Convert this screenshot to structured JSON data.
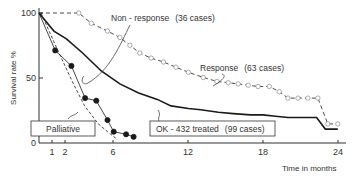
{
  "chart_data": {
    "type": "line",
    "title": "",
    "xlabel": "Time in months",
    "ylabel": "Survival rate %",
    "xlim": [
      0,
      24
    ],
    "ylim": [
      0,
      100
    ],
    "x_ticks": [
      "1",
      "2",
      "6",
      "12",
      "18",
      "24"
    ],
    "y_ticks": [
      "0",
      "50",
      "100"
    ],
    "grid": false,
    "series": [
      {
        "name": "Response (63 cases)",
        "style": "dashed with open circles",
        "points": [
          [
            0,
            100
          ],
          [
            3.2,
            100
          ],
          [
            4.2,
            92
          ],
          [
            5.5,
            86
          ],
          [
            6.5,
            81
          ],
          [
            7.3,
            75
          ],
          [
            8.1,
            69
          ],
          [
            9.0,
            65
          ],
          [
            10.0,
            62
          ],
          [
            11.0,
            58
          ],
          [
            12.0,
            54
          ],
          [
            13.2,
            50
          ],
          [
            14.3,
            47
          ],
          [
            15.2,
            46
          ],
          [
            16.0,
            45
          ],
          [
            16.8,
            44
          ],
          [
            17.6,
            43
          ],
          [
            18.5,
            43
          ],
          [
            19.3,
            39
          ],
          [
            20.0,
            34
          ],
          [
            20.8,
            34
          ],
          [
            21.6,
            34
          ],
          [
            22.4,
            34
          ],
          [
            23.2,
            14
          ],
          [
            24.0,
            14
          ]
        ]
      },
      {
        "name": "OK-432 treated (99 cases)",
        "style": "solid thick",
        "points": [
          [
            0,
            100
          ],
          [
            1.2,
            86
          ],
          [
            2.2,
            80
          ],
          [
            3.5,
            69
          ],
          [
            5.0,
            55
          ],
          [
            6.5,
            45
          ],
          [
            8.0,
            38
          ],
          [
            9.5,
            33
          ],
          [
            10.6,
            28
          ],
          [
            12.0,
            26
          ],
          [
            13.0,
            25
          ],
          [
            14.4,
            23
          ],
          [
            15.6,
            22
          ],
          [
            17.0,
            21
          ],
          [
            18.0,
            21
          ],
          [
            19.0,
            20
          ],
          [
            20.0,
            19
          ],
          [
            21.5,
            19
          ],
          [
            22.3,
            19
          ],
          [
            23.0,
            10
          ],
          [
            24.0,
            10
          ]
        ]
      },
      {
        "name": "Non-response (36 cases)",
        "style": "dashed",
        "points": [
          [
            0,
            100
          ],
          [
            1.4,
            70
          ],
          [
            2.6,
            45
          ],
          [
            3.5,
            28
          ],
          [
            4.6,
            14
          ],
          [
            5.6,
            6
          ],
          [
            6.0,
            3
          ]
        ]
      },
      {
        "name": "Palliative",
        "style": "solid with filled circles",
        "points": [
          [
            0,
            100
          ],
          [
            1.3,
            71
          ],
          [
            2.6,
            59
          ],
          [
            3.7,
            34
          ],
          [
            4.6,
            32
          ],
          [
            5.5,
            17
          ],
          [
            6.0,
            8
          ],
          [
            7.0,
            6
          ],
          [
            7.6,
            4
          ]
        ]
      }
    ],
    "annotations": [
      "Non - response (36 cases)",
      "Response (63 cases)",
      "Palliative",
      "OK - 432 treated (99 cases)"
    ]
  },
  "labels": {
    "nonresponse": "Non - response",
    "nonresponse_cases": "(36 cases)",
    "response": "Response",
    "response_cases": "(63 cases)",
    "palliative": "Palliative",
    "ok432": "OK - 432 treated",
    "ok432_cases": "(99 cases)",
    "xlabel": "Time in months",
    "ylabel": "Survival rate %"
  },
  "ticks": {
    "y100": "100",
    "y50": "50",
    "y0": "0",
    "x1": "1",
    "x2": "2",
    "x6": "6",
    "x12": "12",
    "x18": "18",
    "x24": "24"
  },
  "colors": {
    "line": "#1a1a1a",
    "text": "#333333",
    "background": "#ffffff"
  }
}
